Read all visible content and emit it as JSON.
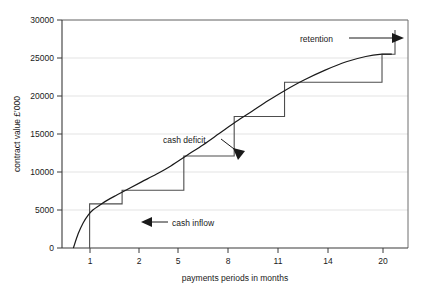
{
  "chart_data": {
    "type": "line",
    "title": "",
    "xlabel": "payments periods in months",
    "ylabel": "contract value £'000",
    "xlim": [
      0.3,
      21.6
    ],
    "ylim": [
      0,
      30000
    ],
    "grid": true,
    "legend_position": "none",
    "x_ticks": [
      "1",
      "2",
      "5",
      "8",
      "11",
      "14",
      "20"
    ],
    "x_tick_values": [
      1,
      2,
      5,
      8,
      11,
      14,
      20
    ],
    "y_ticks": [
      "0",
      "5000",
      "10000",
      "15000",
      "20000",
      "25000",
      "30000"
    ],
    "y_tick_values": [
      0,
      5000,
      10000,
      15000,
      20000,
      25000,
      30000
    ],
    "series": [
      {
        "name": "contract value S-curve",
        "type": "line",
        "x": [
          1.0,
          1.3,
          1.6,
          1.9,
          2.2,
          2.6,
          3.1,
          3.7,
          4.4,
          5.2,
          6.1,
          7.0,
          8.0,
          9.0,
          10.0,
          11.0,
          12.0,
          13.0,
          14.0,
          15.2,
          16.5,
          17.8,
          19.0,
          20.0,
          20.6
        ],
        "y": [
          0,
          1900,
          3300,
          4300,
          5000,
          5600,
          6300,
          7000,
          7800,
          8700,
          9700,
          10800,
          12200,
          13600,
          15100,
          16600,
          18000,
          19400,
          20700,
          22100,
          23400,
          24500,
          25200,
          25500,
          25500
        ]
      },
      {
        "name": "cash inflow (stepped receipts)",
        "type": "step",
        "x": [
          2.0,
          2.0,
          4.0,
          4.0,
          7.8,
          7.8,
          10.9,
          10.9,
          14.0,
          14.0,
          20.0,
          20.0,
          20.8,
          20.8
        ],
        "y": [
          0,
          5800,
          5800,
          7600,
          7600,
          12100,
          12100,
          17300,
          17300,
          21800,
          21800,
          25500,
          25500,
          28700
        ]
      }
    ],
    "annotations": [
      {
        "id": "retention",
        "label": "retention",
        "arrow": "right",
        "text_x": 300,
        "text_y": 42,
        "line_from": [
          349,
          38
        ],
        "line_to": [
          398,
          38
        ]
      },
      {
        "id": "cash-deficit",
        "label": "cash deficit",
        "arrow": "down-right",
        "text_x": 163,
        "text_y": 143,
        "line_from": [
          222,
          140
        ],
        "line_to": [
          240,
          153
        ]
      },
      {
        "id": "cash-inflow",
        "label": "cash inflow",
        "arrow": "left",
        "text_x": 172,
        "text_y": 226,
        "line_from": [
          168,
          222
        ],
        "line_to": [
          141,
          222
        ]
      }
    ],
    "colors": {
      "curve": "#1a1a1a",
      "step": "#4d4d4d",
      "axis": "#4d4d4d",
      "grid": "#dcdcdc",
      "text": "#1a1a1a",
      "background": "#ffffff"
    }
  }
}
